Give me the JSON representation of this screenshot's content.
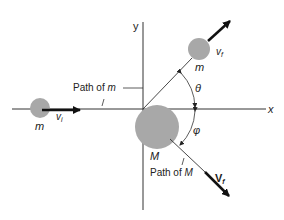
{
  "diagram": {
    "colors": {
      "ball": "#a8a8a8",
      "line": "#333333",
      "arrow": "#111111",
      "background": "#ffffff"
    },
    "axes": {
      "x_label": "x",
      "y_label": "y"
    },
    "incoming_particle": {
      "mass_label": "m",
      "velocity_label": "v",
      "velocity_subscript": "i",
      "path_label": "Path of m"
    },
    "outgoing_particle": {
      "mass_label": "m",
      "velocity_label": "v",
      "velocity_subscript": "f"
    },
    "target": {
      "mass_label": "M",
      "velocity_label": "V",
      "velocity_subscript": "f",
      "path_label": "Path of M"
    },
    "angles": {
      "theta": "θ",
      "phi": "φ"
    }
  }
}
